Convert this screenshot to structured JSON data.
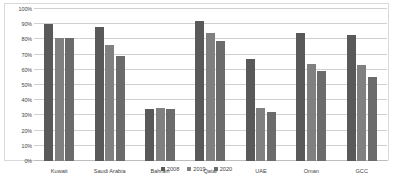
{
  "chart_data": {
    "type": "bar",
    "title": "",
    "subtitle": "",
    "xlabel": "",
    "ylabel": "",
    "ylim": [
      0,
      100
    ],
    "ytick_labels": [
      "100%",
      "90%",
      "80%",
      "70%",
      "60%",
      "50%",
      "40%",
      "30%",
      "20%",
      "10%",
      "0%"
    ],
    "ytick_values": [
      100,
      90,
      80,
      70,
      60,
      50,
      40,
      30,
      20,
      10,
      0
    ],
    "grid": true,
    "legend_position": "bottom",
    "categories": [
      "Kuwait",
      "Saudi Arabia",
      "Bahrain",
      "Qatar",
      "UAE",
      "Oman",
      "GCC"
    ],
    "series": [
      {
        "name": "2008",
        "color": "#595959",
        "values": [
          90,
          88,
          34,
          92,
          67,
          84,
          83
        ]
      },
      {
        "name": "2019",
        "color": "#808080",
        "values": [
          81,
          76,
          35,
          84,
          35,
          64,
          63
        ]
      },
      {
        "name": "2020",
        "color": "#6b6b6b",
        "values": [
          81,
          69,
          34,
          79,
          32,
          59,
          55
        ]
      }
    ]
  },
  "style": {
    "gridline_color": "#d0d0d0",
    "frame_color": "#d9d9d9",
    "text_color": "#3f3f3f",
    "background": "#ffffff"
  }
}
